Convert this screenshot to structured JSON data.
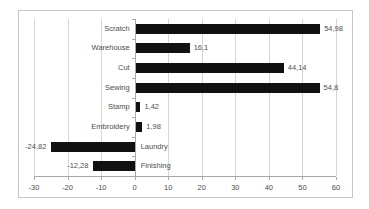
{
  "chart_data": {
    "type": "bar",
    "orientation": "horizontal",
    "title": "",
    "xlabel": "",
    "ylabel": "",
    "categories": [
      "Scratch",
      "Warehouse",
      "Cut",
      "Sewing",
      "Stamp",
      "Embroidery",
      "Laundry",
      "Finishing"
    ],
    "values": [
      54.98,
      16.1,
      44.14,
      54.8,
      1.42,
      1.98,
      -24.82,
      -12.28
    ],
    "value_labels": [
      "54,98",
      "16,1",
      "44,14",
      "54,8",
      "1,42",
      "1,98",
      "-24,82",
      "-12,28"
    ],
    "xlim": [
      -30,
      60
    ],
    "x_ticks": [
      -30,
      -20,
      -10,
      0,
      10,
      20,
      30,
      40,
      50,
      60
    ],
    "x_tick_labels": [
      "-30",
      "-20",
      "-10",
      "0",
      "10",
      "20",
      "30",
      "40",
      "50",
      "60"
    ],
    "grid": "vertical-major-gridlines-on",
    "legend": "none",
    "decimal_separator": ",",
    "colors": {
      "bar": "#111111",
      "gridline": "#d6d6d6",
      "axis": "#a8a8a8",
      "text": "#4d4d4d",
      "frame_border": "#c6c6c6",
      "background": "#ffffff"
    }
  }
}
